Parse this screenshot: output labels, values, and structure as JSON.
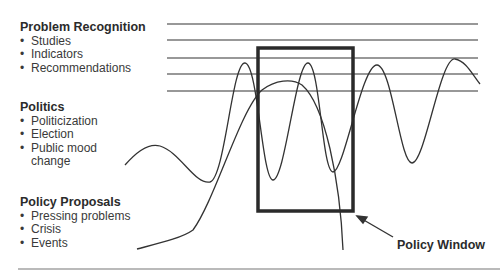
{
  "groups": {
    "problem": {
      "heading": "Problem Recognition",
      "items": [
        "Studies",
        "Indicators",
        "Recommendations"
      ]
    },
    "politics": {
      "heading": "Politics",
      "items": [
        "Politicization",
        "Election",
        "Public mood",
        "change"
      ]
    },
    "proposals": {
      "heading": "Policy Proposals",
      "items": [
        "Pressing problems",
        "Crisis",
        "Events"
      ]
    }
  },
  "policy_window_label": "Policy Window",
  "colors": {
    "line": "#333333",
    "box": "#2a2a2a",
    "separator": "#777777"
  }
}
